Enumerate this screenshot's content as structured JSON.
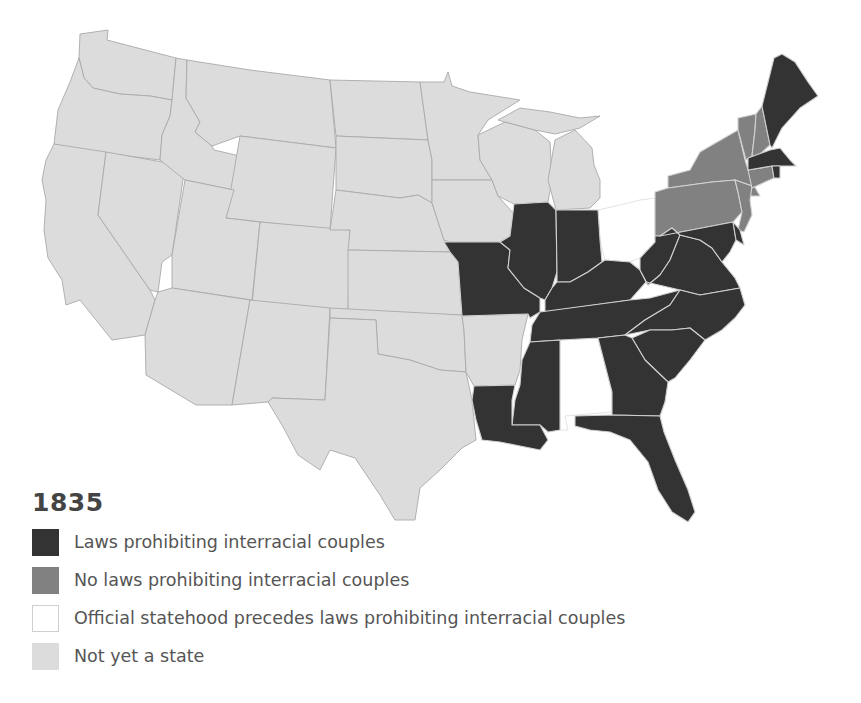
{
  "legend": {
    "year": "1835",
    "items": [
      {
        "key": "laws",
        "label": "Laws prohibiting interracial couples",
        "color": "#333333",
        "border": "#333333"
      },
      {
        "key": "no_laws",
        "label": "No laws prohibiting interracial couples",
        "color": "#818181",
        "border": "#818181"
      },
      {
        "key": "statehood_precedes",
        "label": "Official statehood precedes laws prohibiting interracial couples",
        "color": "#ffffff",
        "border": "#cfcfcf"
      },
      {
        "key": "not_state",
        "label": "Not yet a state",
        "color": "#dcdcdc",
        "border": "#d0d0d0"
      }
    ]
  },
  "map": {
    "region": "Contiguous United States",
    "categories": {
      "laws": [
        "Maine",
        "Massachusetts",
        "Rhode Island",
        "Missouri",
        "Illinois",
        "Indiana",
        "Kentucky",
        "Tennessee",
        "Virginia",
        "West Virginia",
        "Maryland",
        "Delaware",
        "North Carolina",
        "South Carolina",
        "Georgia",
        "Florida",
        "Mississippi",
        "Louisiana"
      ],
      "no_laws": [
        "New York",
        "Pennsylvania",
        "New Jersey",
        "Vermont",
        "New Hampshire",
        "Connecticut"
      ],
      "statehood_precedes": [
        "Ohio",
        "Alabama"
      ],
      "not_state": [
        "Washington",
        "Oregon",
        "California",
        "Nevada",
        "Idaho",
        "Montana",
        "Wyoming",
        "Utah",
        "Arizona",
        "Colorado",
        "New Mexico",
        "North Dakota",
        "South Dakota",
        "Nebraska",
        "Kansas",
        "Oklahoma",
        "Texas",
        "Minnesota",
        "Iowa",
        "Wisconsin",
        "Michigan",
        "Arkansas"
      ]
    }
  }
}
